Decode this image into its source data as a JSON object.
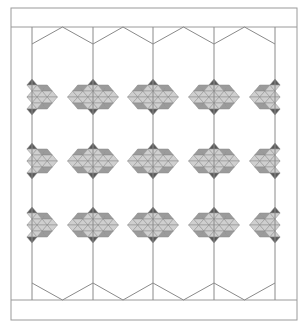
{
  "diagram": {
    "type": "quilt-pattern",
    "canvas": {
      "width": 307,
      "height": 328
    },
    "colors": {
      "background": "#ffffff",
      "line": "#8a8a8a",
      "frame_line": "#9a9a9a",
      "dark": "#5a5a5a",
      "medium": "#9b9b9b",
      "light": "#cfcfcf"
    },
    "frame": {
      "x1": 11,
      "y1": 8,
      "x2": 297,
      "y2": 320
    },
    "top_band_bottom": 27,
    "bottom_band_top": 300,
    "columns_x": [
      32,
      93,
      153,
      214,
      275
    ],
    "hexagon_top": {
      "peak_y": 27,
      "valley_y": 44
    },
    "hexagon_bottom": {
      "peak_y": 283,
      "valley_y": 300
    },
    "diamond_rows_y": [
      97,
      161,
      225
    ],
    "diamond_half_height": 18
  }
}
